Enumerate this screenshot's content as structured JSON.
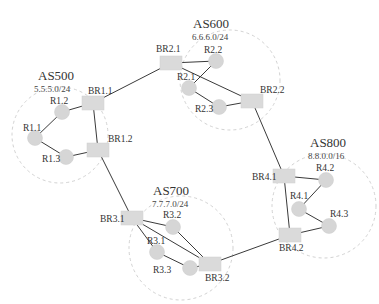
{
  "diagram": {
    "type": "network-topology",
    "colors": {
      "link": "#3a3a3a",
      "node_fill": "#d8d8d8",
      "as_boundary": "#d2d2d2",
      "text": "#333333"
    },
    "autonomous_systems": [
      {
        "id": "as500",
        "name": "AS500",
        "prefix": "5.5.5.0/24",
        "cx": 60,
        "cy": 135,
        "r": 48,
        "title_x": 38,
        "title_y": 80,
        "prefix_x": 34,
        "prefix_y": 92
      },
      {
        "id": "as600",
        "name": "AS600",
        "prefix": "6.6.6.0/24",
        "cx": 230,
        "cy": 80,
        "r": 50,
        "title_x": 193,
        "title_y": 28,
        "prefix_x": 192,
        "prefix_y": 40
      },
      {
        "id": "as700",
        "name": "AS700",
        "prefix": "7.7.7.0/24",
        "cx": 181,
        "cy": 248,
        "r": 52,
        "title_x": 153,
        "title_y": 195,
        "prefix_x": 152,
        "prefix_y": 207
      },
      {
        "id": "as800",
        "name": "AS800",
        "prefix": "8.8.0.0/16",
        "cx": 324,
        "cy": 206,
        "r": 52,
        "title_x": 310,
        "title_y": 147,
        "prefix_x": 308,
        "prefix_y": 159
      }
    ],
    "nodes": [
      {
        "id": "BR1.1",
        "label": "BR1.1",
        "kind": "border-router",
        "x": 93,
        "y": 103,
        "lx": 88,
        "ly": 94
      },
      {
        "id": "BR1.2",
        "label": "BR1.2",
        "kind": "border-router",
        "x": 98,
        "y": 150,
        "lx": 108,
        "ly": 142
      },
      {
        "id": "R1.1",
        "label": "R1.1",
        "kind": "router",
        "x": 35,
        "y": 138,
        "lx": 23,
        "ly": 131
      },
      {
        "id": "R1.2",
        "label": "R1.2",
        "kind": "router",
        "x": 62,
        "y": 112,
        "lx": 50,
        "ly": 104
      },
      {
        "id": "R1.3",
        "label": "R1.3",
        "kind": "router",
        "x": 66,
        "y": 157,
        "lx": 42,
        "ly": 162
      },
      {
        "id": "BR2.1",
        "label": "BR2.1",
        "kind": "border-router",
        "x": 171,
        "y": 63,
        "lx": 156,
        "ly": 52
      },
      {
        "id": "BR2.2",
        "label": "BR2.2",
        "kind": "border-router",
        "x": 252,
        "y": 101,
        "lx": 260,
        "ly": 93
      },
      {
        "id": "R2.1",
        "label": "R2.1",
        "kind": "router",
        "x": 189,
        "y": 88,
        "lx": 177,
        "ly": 80
      },
      {
        "id": "R2.2",
        "label": "R2.2",
        "kind": "router",
        "x": 216,
        "y": 61,
        "lx": 204,
        "ly": 53
      },
      {
        "id": "R2.3",
        "label": "R2.3",
        "kind": "router",
        "x": 219,
        "y": 107,
        "lx": 195,
        "ly": 112
      },
      {
        "id": "BR3.1",
        "label": "BR3.1",
        "kind": "border-router",
        "x": 132,
        "y": 218,
        "lx": 100,
        "ly": 222
      },
      {
        "id": "BR3.2",
        "label": "BR3.2",
        "kind": "border-router",
        "x": 210,
        "y": 264,
        "lx": 205,
        "ly": 281
      },
      {
        "id": "R3.1",
        "label": "R3.1",
        "kind": "router",
        "x": 157,
        "y": 252,
        "lx": 147,
        "ly": 244
      },
      {
        "id": "R3.2",
        "label": "R3.2",
        "kind": "router",
        "x": 173,
        "y": 227,
        "lx": 163,
        "ly": 218
      },
      {
        "id": "R3.3",
        "label": "R3.3",
        "kind": "router",
        "x": 190,
        "y": 268,
        "lx": 153,
        "ly": 273
      },
      {
        "id": "BR4.1",
        "label": "BR4.1",
        "kind": "border-router",
        "x": 284,
        "y": 176,
        "lx": 252,
        "ly": 180
      },
      {
        "id": "BR4.2",
        "label": "BR4.2",
        "kind": "border-router",
        "x": 290,
        "y": 235,
        "lx": 279,
        "ly": 251
      },
      {
        "id": "R4.1",
        "label": "R4.1",
        "kind": "router",
        "x": 299,
        "y": 209,
        "lx": 290,
        "ly": 199
      },
      {
        "id": "R4.2",
        "label": "R4.2",
        "kind": "router",
        "x": 326,
        "y": 180,
        "lx": 316,
        "ly": 171
      },
      {
        "id": "R4.3",
        "label": "R4.3",
        "kind": "router",
        "x": 329,
        "y": 226,
        "lx": 330,
        "ly": 217
      }
    ],
    "links": [
      [
        "R1.1",
        "R1.2"
      ],
      [
        "R1.1",
        "R1.3"
      ],
      [
        "R1.2",
        "BR1.1"
      ],
      [
        "R1.3",
        "BR1.2"
      ],
      [
        "BR1.1",
        "BR1.2"
      ],
      [
        "BR1.1",
        "BR2.1"
      ],
      [
        "BR1.2",
        "BR3.1"
      ],
      [
        "BR2.1",
        "R2.2"
      ],
      [
        "R2.2",
        "R2.1"
      ],
      [
        "R2.1",
        "R2.3"
      ],
      [
        "R2.3",
        "BR2.2"
      ],
      [
        "BR2.1",
        "BR2.2"
      ],
      [
        "BR2.2",
        "BR4.1"
      ],
      [
        "BR3.1",
        "R3.2"
      ],
      [
        "BR3.1",
        "R3.1"
      ],
      [
        "R3.1",
        "R3.3"
      ],
      [
        "R3.3",
        "BR3.2"
      ],
      [
        "R3.2",
        "BR3.2"
      ],
      [
        "BR3.1",
        "BR3.2"
      ],
      [
        "BR3.2",
        "BR4.2"
      ],
      [
        "BR4.1",
        "R4.2"
      ],
      [
        "R4.2",
        "R4.1"
      ],
      [
        "R4.1",
        "R4.3"
      ],
      [
        "R4.3",
        "BR4.2"
      ],
      [
        "BR4.1",
        "BR4.2"
      ]
    ]
  }
}
